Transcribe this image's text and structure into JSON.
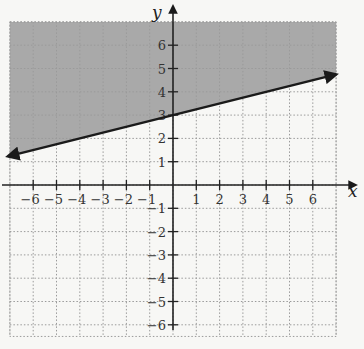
{
  "chart_data": {
    "type": "inequality-graph",
    "title": "",
    "xlabel": "x",
    "ylabel": "y",
    "xlim": [
      -7,
      7
    ],
    "ylim": [
      -6.5,
      7
    ],
    "x_ticks": [
      -6,
      -5,
      -4,
      -3,
      -2,
      -1,
      1,
      2,
      3,
      4,
      5,
      6
    ],
    "y_ticks": [
      -6,
      -5,
      -4,
      -3,
      -2,
      -1,
      1,
      2,
      3,
      4,
      5,
      6
    ],
    "grid": true,
    "grid_style": "dotted",
    "boundary_line": {
      "equation": "y = (1/4)x + 3",
      "slope": 0.25,
      "intercept": 3,
      "style": "solid",
      "arrows": "both",
      "from": [
        -7,
        1.25
      ],
      "to": [
        7,
        4.75
      ]
    },
    "inequality": "y >= (1/4)x + 3",
    "shaded_region": "above",
    "shade_color": "#a9a9a9"
  },
  "colors": {
    "background": "#f7f7f5",
    "grid": "#9a9a9a",
    "axis": "#222222",
    "line": "#1a1a1a",
    "shade": "#a9a9a9"
  }
}
